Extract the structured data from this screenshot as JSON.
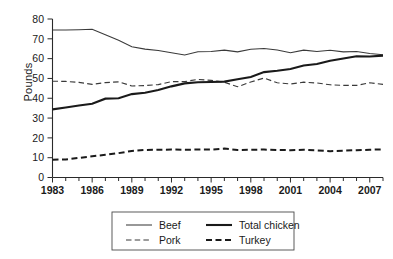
{
  "chart_data": {
    "type": "line",
    "title": "",
    "xlabel": "",
    "ylabel": "Pounds",
    "xlim": [
      1983,
      2008
    ],
    "ylim": [
      0,
      80
    ],
    "ytick_labels": [
      "0",
      "10",
      "20",
      "30",
      "40",
      "50",
      "60",
      "70",
      "80"
    ],
    "ytick_values": [
      0,
      10,
      20,
      30,
      40,
      50,
      60,
      70,
      80
    ],
    "xtick_labels": [
      "1983",
      "1986",
      "1989",
      "1992",
      "1995",
      "1998",
      "2001",
      "2004",
      "2007"
    ],
    "xtick_values": [
      1983,
      1986,
      1989,
      1992,
      1995,
      1998,
      2001,
      2004,
      2007
    ],
    "minor_xticks": [
      1983,
      1984,
      1985,
      1986,
      1987,
      1988,
      1989,
      1990,
      1991,
      1992,
      1993,
      1994,
      1995,
      1996,
      1997,
      1998,
      1999,
      2000,
      2001,
      2002,
      2003,
      2004,
      2005,
      2006,
      2007,
      2008
    ],
    "grid": false,
    "legend_position": "below-center",
    "x": [
      1983,
      1984,
      1985,
      1986,
      1987,
      1988,
      1989,
      1990,
      1991,
      1992,
      1993,
      1994,
      1995,
      1996,
      1997,
      1998,
      1999,
      2000,
      2001,
      2002,
      2003,
      2004,
      2005,
      2006,
      2007,
      2008
    ],
    "series": [
      {
        "name": "Beef",
        "style": "thin-solid",
        "color": "#3a3a3a",
        "values": [
          74.5,
          74.4,
          74.6,
          74.8,
          72.0,
          69.3,
          66.0,
          64.8,
          64.1,
          63.0,
          61.8,
          63.5,
          63.6,
          64.3,
          63.4,
          64.7,
          65.1,
          64.4,
          63.0,
          64.3,
          63.6,
          64.2,
          63.4,
          63.6,
          62.6,
          62.0
        ]
      },
      {
        "name": "Pork",
        "style": "thin-dashed",
        "color": "#3a3a3a",
        "values": [
          48.6,
          48.5,
          48.0,
          47.0,
          47.9,
          48.3,
          46.2,
          46.4,
          46.9,
          48.4,
          48.4,
          49.5,
          49.0,
          48.1,
          45.8,
          48.2,
          50.2,
          47.8,
          47.2,
          48.1,
          47.7,
          46.8,
          46.5,
          46.5,
          47.8,
          47.0
        ]
      },
      {
        "name": "Total chicken",
        "style": "thick-solid",
        "color": "#1a1a1a",
        "values": [
          34.4,
          35.3,
          36.3,
          37.2,
          39.8,
          40.0,
          42.1,
          42.8,
          44.2,
          46.0,
          47.5,
          48.1,
          48.2,
          48.4,
          49.6,
          50.7,
          53.2,
          53.9,
          54.8,
          56.5,
          57.3,
          58.9,
          60.1,
          61.2,
          61.1,
          61.5
        ]
      },
      {
        "name": "Turkey",
        "style": "thick-dashed",
        "color": "#1a1a1a",
        "values": [
          9.0,
          9.1,
          9.9,
          10.7,
          11.5,
          12.3,
          13.4,
          13.9,
          14.0,
          14.1,
          14.0,
          14.1,
          14.1,
          14.6,
          13.9,
          14.0,
          14.1,
          13.9,
          13.8,
          14.0,
          13.7,
          13.3,
          13.5,
          13.8,
          14.0,
          14.2
        ]
      }
    ]
  },
  "legend": {
    "entries": [
      {
        "label": "Beef",
        "style": "thin-solid"
      },
      {
        "label": "Total chicken",
        "style": "thick-solid"
      },
      {
        "label": "Pork",
        "style": "thin-dashed"
      },
      {
        "label": "Turkey",
        "style": "thick-dashed"
      }
    ]
  }
}
